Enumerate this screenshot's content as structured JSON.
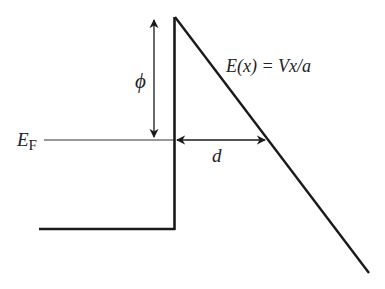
{
  "diagram": {
    "type": "energy band diagram (field emission / Fowler-Nordheim barrier)",
    "labels": {
      "fermi_level": "E",
      "fermi_level_subscript": "F",
      "work_function": "ϕ",
      "distance": "d",
      "equation": "E(x) = Vx/a"
    },
    "colors": {
      "line": "#1a1a1a",
      "text": "#222222",
      "background": "#ffffff"
    }
  }
}
